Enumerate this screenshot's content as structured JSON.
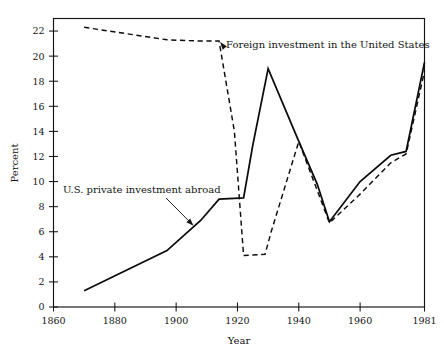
{
  "chart_data": {
    "type": "line",
    "title": "",
    "xlabel": "Year",
    "ylabel": "Percent",
    "xlim": [
      1860,
      1981
    ],
    "ylim": [
      0,
      23
    ],
    "grid": false,
    "legend_position": "inline-annotations",
    "xticks": [
      1860,
      1880,
      1900,
      1920,
      1940,
      1960,
      1981
    ],
    "xtick_labels": [
      "1860",
      "1880",
      "1900",
      "1920",
      "1940",
      "1960",
      "1981"
    ],
    "yticks": [
      0,
      2,
      4,
      6,
      8,
      10,
      12,
      14,
      16,
      18,
      20,
      22
    ],
    "ytick_labels": [
      "0",
      "2",
      "4",
      "6",
      "8",
      "10",
      "12",
      "14",
      "16",
      "18",
      "20",
      "22"
    ],
    "series": [
      {
        "name": "Foreign investment in the United States",
        "style": "dashed",
        "x": [
          1870,
          1897,
          1908,
          1914,
          1919,
          1922,
          1929,
          1931,
          1940,
          1946,
          1950,
          1960,
          1970,
          1975,
          1981
        ],
        "values": [
          22.3,
          21.3,
          21.2,
          21.2,
          14.0,
          4.1,
          4.2,
          6.0,
          13.2,
          9.3,
          6.7,
          9.0,
          11.5,
          12.2,
          18.8
        ]
      },
      {
        "name": "U.S. private investment abroad",
        "style": "solid",
        "x": [
          1870,
          1897,
          1908,
          1914,
          1922,
          1925,
          1930,
          1940,
          1946,
          1950,
          1960,
          1970,
          1975,
          1981
        ],
        "values": [
          1.3,
          4.5,
          6.9,
          8.6,
          8.7,
          12.9,
          19.0,
          13.2,
          9.8,
          6.8,
          10.0,
          12.1,
          12.4,
          19.5
        ]
      }
    ],
    "annotations": [
      {
        "id": "foreign-investment-label",
        "text": "Foreign investment in the United States",
        "points_to_series": "Foreign investment in the United States",
        "points_to_x": 1914,
        "points_to_y": 21.2
      },
      {
        "id": "us-private-investment-label",
        "text": "U.S. private investment abroad",
        "points_to_series": "U.S. private investment abroad",
        "points_to_x": 1906,
        "points_to_y": 6.4
      }
    ]
  }
}
